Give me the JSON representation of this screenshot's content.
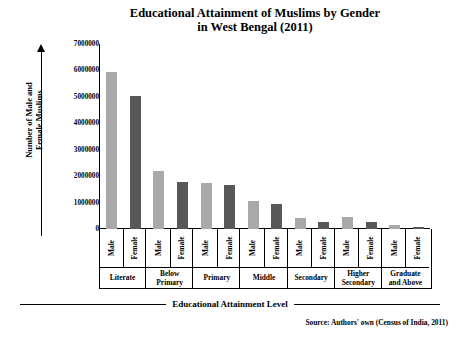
{
  "chart_data": {
    "type": "bar",
    "title": "Educational Attainment of Muslims by Gender in West Bengal (2011)",
    "title_line1": "Educational Attainment of Muslims by Gender",
    "title_line2": "in West Bengal (2011)",
    "xlabel": "Educational Attainment Level",
    "ylabel": "Number of Male and Female Muslims",
    "ylabel_line1": "Number of Male and",
    "ylabel_line2": "Female Muslims",
    "categories": [
      "Literate",
      "Below Primary",
      "Primary",
      "Middle",
      "Secondary",
      "Higher Secondary",
      "Graduate and Above"
    ],
    "category_lines": [
      [
        "Literate"
      ],
      [
        "Below",
        "Primary"
      ],
      [
        "Primary"
      ],
      [
        "Middle"
      ],
      [
        "Secondary"
      ],
      [
        "Higher",
        "Secondary"
      ],
      [
        "Graduate",
        "and Above"
      ]
    ],
    "series": [
      {
        "name": "Male",
        "color": "#a9a9a9",
        "values": [
          5950000,
          2200000,
          1750000,
          1050000,
          420000,
          450000,
          150000
        ]
      },
      {
        "name": "Female",
        "color": "#585858",
        "values": [
          5050000,
          1780000,
          1650000,
          950000,
          270000,
          250000,
          60000
        ]
      }
    ],
    "ylim": [
      0,
      7000000
    ],
    "yticks": [
      0,
      1000000,
      2000000,
      3000000,
      4000000,
      5000000,
      6000000,
      7000000
    ],
    "ytick_labels": [
      "0",
      "1000000",
      "2000000",
      "3000000",
      "4000000",
      "5000000",
      "6000000",
      "7000000"
    ],
    "grid": false,
    "legend": "none",
    "source": "Source: Authors' own (Census of India, 2011)"
  }
}
